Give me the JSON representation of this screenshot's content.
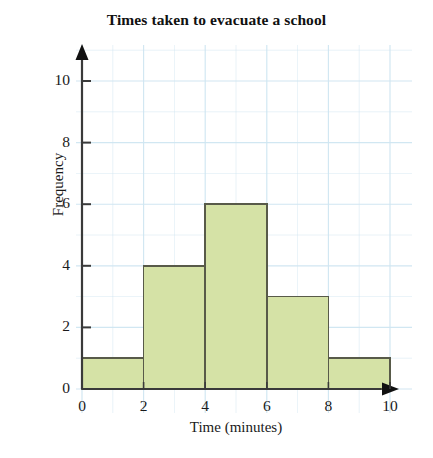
{
  "chart_data": {
    "type": "bar",
    "title": "Times taken to evacuate a school",
    "xlabel": "Time (minutes)",
    "ylabel": "Frequency",
    "categories": [
      "0-2",
      "2-4",
      "4-6",
      "6-8",
      "8-10"
    ],
    "bin_edges": [
      0,
      2,
      4,
      6,
      8,
      10
    ],
    "values": [
      1,
      4,
      6,
      3,
      1
    ],
    "xlim": [
      0,
      10
    ],
    "ylim": [
      0,
      11
    ],
    "x_ticks": [
      "0",
      "2",
      "4",
      "6",
      "8",
      "10"
    ],
    "x_tick_values": [
      0,
      2,
      4,
      6,
      8,
      10
    ],
    "y_ticks": [
      "0",
      "2",
      "4",
      "6",
      "8",
      "10"
    ],
    "y_tick_values": [
      0,
      2,
      4,
      6,
      8,
      10
    ],
    "grid": true,
    "grid_step_x": 1,
    "grid_step_y": 1,
    "legend": null,
    "bar_fill_color": "#d5e2a6",
    "bar_edge_color": "#585a49",
    "grid_color": "#cfe6f2",
    "axis_color": "#3a3a3a",
    "background_color": "#ffffff"
  }
}
